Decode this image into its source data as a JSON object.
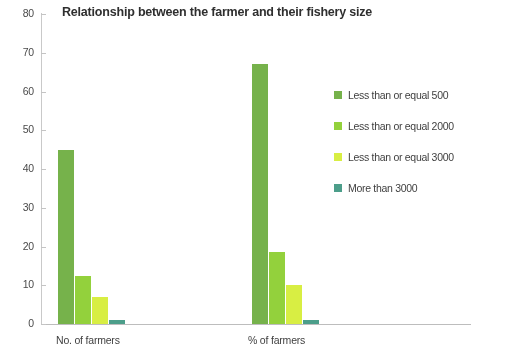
{
  "chart_data": {
    "type": "bar",
    "title": "Relationship between the farmer and their fishery size",
    "xlabel": "",
    "ylabel": "",
    "categories": [
      "No. of farmers",
      "% of farmers"
    ],
    "ylim": [
      0,
      80
    ],
    "yticks": [
      0,
      10,
      20,
      30,
      40,
      50,
      60,
      70,
      80
    ],
    "grid": false,
    "legend_position": "right",
    "series": [
      {
        "name": "Less than or equal 500",
        "values": [
          45,
          67
        ],
        "color": "#76B24B"
      },
      {
        "name": "Less than or equal 2000",
        "values": [
          12.5,
          18.5
        ],
        "color": "#93D13C"
      },
      {
        "name": "Less than or equal 3000",
        "values": [
          7,
          10
        ],
        "color": "#D8EE43"
      },
      {
        "name": "More than 3000",
        "values": [
          1,
          1
        ],
        "color": "#4C9E8A"
      }
    ]
  },
  "axis": {
    "y_tick_labels": [
      "80",
      "70",
      "60",
      "50",
      "40",
      "30",
      "20",
      "10",
      "0"
    ]
  }
}
